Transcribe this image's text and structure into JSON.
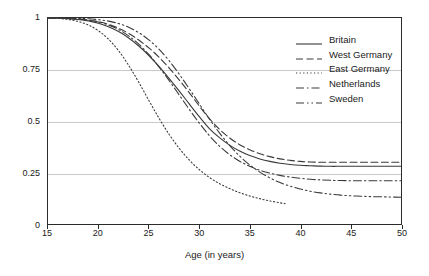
{
  "chart_data": {
    "type": "line",
    "title": "",
    "xlabel": "Age (in years)",
    "ylabel": "",
    "xlim": [
      15,
      50
    ],
    "ylim": [
      0,
      1
    ],
    "xticks": [
      15,
      20,
      25,
      30,
      35,
      40,
      45,
      50
    ],
    "xtick_labels": [
      "15",
      "20",
      "25",
      "30",
      "35",
      "40",
      "45",
      "50"
    ],
    "yticks": [
      0,
      0.25,
      0.5,
      0.75,
      1
    ],
    "ytick_labels": [
      "0",
      "0.25",
      "0.5",
      "0.75",
      "1"
    ],
    "grid": "horizontal",
    "legend_position": "upper right",
    "x": [
      15,
      16,
      17,
      18,
      19,
      20,
      21,
      22,
      23,
      24,
      25,
      26,
      27,
      28,
      29,
      30,
      31,
      32,
      33,
      34,
      35,
      36,
      37,
      38,
      39,
      40,
      41,
      42,
      43,
      44,
      45,
      46,
      47,
      48,
      49,
      50
    ],
    "series": [
      {
        "name": "Britain",
        "style": "solid",
        "color": "#3a3a3a",
        "values": [
          1.0,
          0.999,
          0.997,
          0.993,
          0.986,
          0.975,
          0.958,
          0.934,
          0.903,
          0.864,
          0.818,
          0.765,
          0.707,
          0.646,
          0.583,
          0.521,
          0.463,
          0.419,
          0.383,
          0.354,
          0.332,
          0.316,
          0.304,
          0.295,
          0.289,
          0.285,
          0.283,
          0.281,
          0.28,
          0.28,
          0.28,
          0.28,
          0.28,
          0.28,
          0.28,
          0.28
        ]
      },
      {
        "name": "West Germany",
        "style": "dashed",
        "color": "#3a3a3a",
        "values": [
          1.0,
          0.999,
          0.998,
          0.995,
          0.99,
          0.982,
          0.969,
          0.95,
          0.925,
          0.893,
          0.855,
          0.81,
          0.758,
          0.7,
          0.638,
          0.573,
          0.512,
          0.46,
          0.418,
          0.385,
          0.36,
          0.341,
          0.327,
          0.316,
          0.309,
          0.304,
          0.301,
          0.3,
          0.3,
          0.3,
          0.3,
          0.3,
          0.3,
          0.3,
          0.3,
          0.3
        ]
      },
      {
        "name": "East Germany",
        "style": "dotted",
        "color": "#3a3a3a",
        "values": [
          1.0,
          0.998,
          0.993,
          0.983,
          0.966,
          0.938,
          0.897,
          0.841,
          0.77,
          0.688,
          0.6,
          0.514,
          0.436,
          0.368,
          0.311,
          0.264,
          0.226,
          0.196,
          0.172,
          0.152,
          0.136,
          0.123,
          0.112,
          0.103,
          0.095,
          0.088,
          0.083,
          0.08,
          0.08,
          0.08,
          0.08,
          0.08,
          0.08,
          0.08,
          0.08,
          0.08
        ],
        "ends_at_x": 38.5,
        "note": "series terminates before the right edge of the plot"
      },
      {
        "name": "Netherlands",
        "style": "dashdot",
        "color": "#3a3a3a",
        "values": [
          1.0,
          0.999,
          0.998,
          0.995,
          0.99,
          0.981,
          0.966,
          0.944,
          0.913,
          0.873,
          0.823,
          0.763,
          0.697,
          0.627,
          0.557,
          0.49,
          0.429,
          0.378,
          0.337,
          0.305,
          0.28,
          0.261,
          0.247,
          0.236,
          0.228,
          0.222,
          0.217,
          0.214,
          0.212,
          0.211,
          0.21,
          0.21,
          0.21,
          0.21,
          0.21,
          0.21
        ]
      },
      {
        "name": "Sweden",
        "style": "dashdotdot",
        "color": "#3a3a3a",
        "values": [
          1.0,
          1.0,
          0.999,
          0.998,
          0.996,
          0.992,
          0.985,
          0.973,
          0.955,
          0.929,
          0.894,
          0.849,
          0.793,
          0.728,
          0.657,
          0.583,
          0.51,
          0.442,
          0.382,
          0.33,
          0.287,
          0.252,
          0.224,
          0.201,
          0.184,
          0.17,
          0.159,
          0.151,
          0.145,
          0.14,
          0.137,
          0.135,
          0.133,
          0.132,
          0.131,
          0.13
        ]
      }
    ]
  },
  "legend": {
    "items": [
      {
        "label": "Britain"
      },
      {
        "label": "West Germany"
      },
      {
        "label": "East Germany"
      },
      {
        "label": "Netherlands"
      },
      {
        "label": "Sweden"
      }
    ]
  },
  "axes": {
    "xaxis_title": "Age (in years)"
  },
  "corner": {
    "mark": ""
  }
}
